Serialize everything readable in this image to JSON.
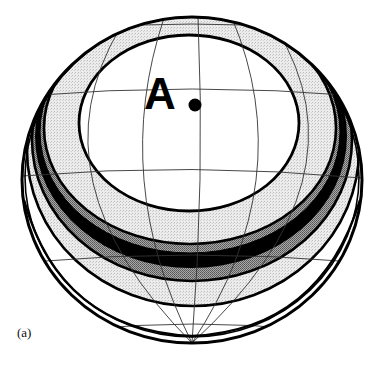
{
  "figure": {
    "panel_label": "(a)",
    "point_label": "A",
    "point_label_suffix": ".",
    "colors": {
      "background": "#ffffff",
      "line": "#000000",
      "grid": "#333333",
      "light_stipple": "#e6e6e6",
      "medium_gray": "#8c8c8c",
      "dark_band": "#000000",
      "inner_region": "#ffffff"
    },
    "bands": [
      {
        "name": "inner-region",
        "fill": "white"
      },
      {
        "name": "light-band-1",
        "fill": "light stipple"
      },
      {
        "name": "gray-band-upper",
        "fill": "medium gray"
      },
      {
        "name": "black-band",
        "fill": "black"
      },
      {
        "name": "gray-band-lower",
        "fill": "medium gray"
      },
      {
        "name": "light-band-2",
        "fill": "light stipple"
      },
      {
        "name": "outer-region",
        "fill": "white"
      }
    ]
  }
}
